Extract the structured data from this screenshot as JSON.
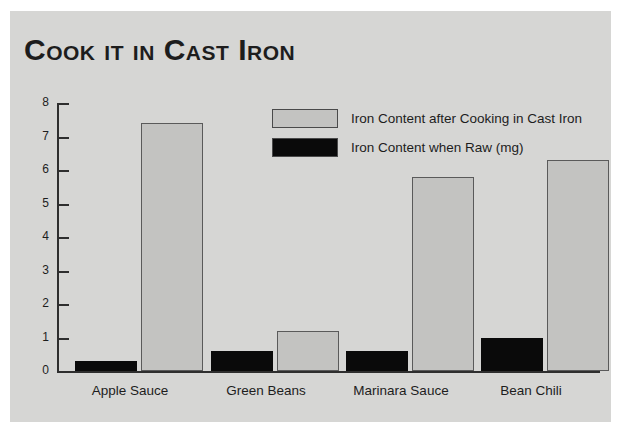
{
  "figure": {
    "background_color": "#d6d6d4",
    "outer_background_color": "#ffffff",
    "title": "Cook it in Cast Iron"
  },
  "legend": {
    "position": "upper-center-right",
    "entries": [
      {
        "label": "Iron Content after Cooking in Cast Iron",
        "swatch_color": "#c3c3c1",
        "series_key": "cooked"
      },
      {
        "label": "Iron Content when Raw (mg)",
        "swatch_color": "#0a0a0a",
        "series_key": "raw"
      }
    ]
  },
  "axis": {
    "y_tick_labels": [
      "8",
      "7",
      "6",
      "5",
      "4",
      "3",
      "2",
      "1",
      "0"
    ],
    "x_tick_labels": [
      "Apple Sauce",
      "Green Beans",
      "Marinara Sauce",
      "Bean Chili"
    ]
  },
  "chart_data": {
    "type": "bar",
    "title": "Cook it in Cast Iron",
    "xlabel": "",
    "ylabel": "",
    "ylim": [
      0,
      8
    ],
    "yticks": [
      0,
      1,
      2,
      3,
      4,
      5,
      6,
      7,
      8
    ],
    "grid": false,
    "legend_position": "upper right",
    "categories": [
      "Apple Sauce",
      "Green Beans",
      "Marinara Sauce",
      "Bean Chili"
    ],
    "series": [
      {
        "name": "Iron Content when Raw (mg)",
        "key": "raw",
        "color": "#0a0a0a",
        "values": [
          0.3,
          0.6,
          0.6,
          1.0
        ]
      },
      {
        "name": "Iron Content after Cooking in Cast Iron",
        "key": "cooked",
        "color": "#c3c3c1",
        "values": [
          7.4,
          1.2,
          5.8,
          6.3
        ]
      }
    ],
    "units": "mg"
  }
}
